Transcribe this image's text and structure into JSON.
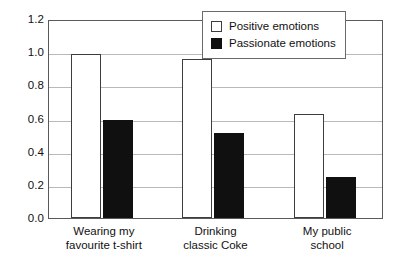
{
  "chart_data": {
    "type": "bar",
    "title": "",
    "subtitle": "",
    "xlabel": "",
    "ylabel": "",
    "ylim": [
      0.0,
      1.2
    ],
    "ytick_values": [
      0.0,
      0.2,
      0.4,
      0.6,
      0.8,
      1.0,
      1.2
    ],
    "ytick_labels": [
      "0.0",
      "0.2",
      "0.4",
      "0.6",
      "0.8",
      "1.0",
      "1.2"
    ],
    "grid": true,
    "grid_axis": "y",
    "legend_position": "top-right-inside",
    "categories": [
      "Wearing my favourite t-shirt",
      "Drinking classic Coke",
      "My public school"
    ],
    "category_lines": [
      [
        "Wearing my",
        "favourite t-shirt"
      ],
      [
        "Drinking",
        "classic Coke"
      ],
      [
        "My public",
        "school"
      ]
    ],
    "series": [
      {
        "name": "Positive emotions",
        "fill": "#ffffff",
        "edge": "#3d3d3d",
        "values": [
          0.99,
          0.96,
          0.63
        ]
      },
      {
        "name": "Passionate emotions",
        "fill": "#101010",
        "edge": "#101010",
        "values": [
          0.59,
          0.51,
          0.245
        ]
      }
    ]
  },
  "legend": {
    "items": [
      {
        "label": "Positive emotions",
        "swatch": "open-square-swatch"
      },
      {
        "label": "Passionate emotions",
        "swatch": "filled-square-swatch"
      }
    ]
  }
}
